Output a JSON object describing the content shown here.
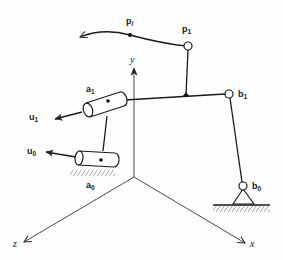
{
  "diagram": {
    "type": "spatial linkage / mechanism schematic",
    "axes": {
      "x_label": "x",
      "y_label": "y",
      "z_label": "z",
      "origin": [
        134,
        177
      ]
    },
    "labels": {
      "p_i": {
        "main": "p",
        "sub": "i"
      },
      "p_1": {
        "main": "p",
        "sub": "1"
      },
      "a_1": {
        "main": "a",
        "sub": "1"
      },
      "a_0": {
        "main": "a",
        "sub": "0"
      },
      "b_1": {
        "main": "b",
        "sub": "1"
      },
      "b_0": {
        "main": "b",
        "sub": "0"
      },
      "u_1": {
        "main": "u",
        "sub": "1"
      },
      "u_0": {
        "main": "u",
        "sub": "0"
      }
    },
    "components": [
      "coupler point trajectory curve through p_i ending in arrow",
      "coupler point p_1 (revolute joint)",
      "cylindrical joint a_1 with axis u_1",
      "cylindrical joint a_0 fixed to ground with axis u_0",
      "spherical/revolute joint b_1",
      "ground pivot b_0 with support triangle",
      "coordinate frame x, y, z"
    ],
    "colors": {
      "ink": "#1a1a1a",
      "background": "#fdfdfd"
    }
  }
}
